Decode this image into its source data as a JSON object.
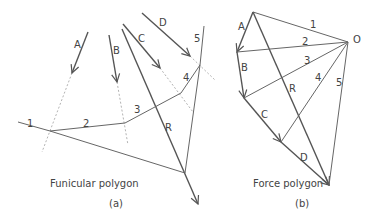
{
  "figure": {
    "left": {
      "title": "Funicular polygon",
      "sublabel": "(a)",
      "forces": [
        "A",
        "B",
        "C",
        "D"
      ],
      "strings": [
        "1",
        "2",
        "3",
        "4",
        "5"
      ],
      "resultant": "R"
    },
    "right": {
      "title": "Force polygon",
      "sublabel": "(b)",
      "pole": "O",
      "forces": [
        "A",
        "B",
        "C",
        "D"
      ],
      "rays": [
        "1",
        "2",
        "3",
        "4",
        "5"
      ],
      "resultant": "R"
    }
  },
  "colors": {
    "line": "#555555",
    "dashed": "#aaaaaa",
    "text": "#444444"
  }
}
